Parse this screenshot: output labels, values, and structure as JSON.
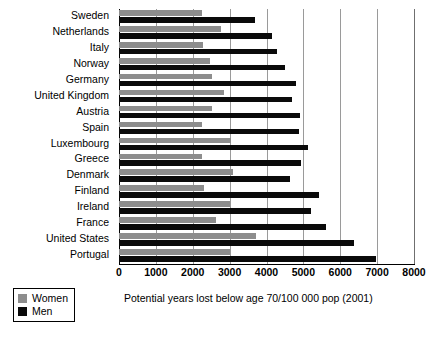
{
  "chart_data": {
    "type": "bar",
    "orientation": "horizontal",
    "title": "",
    "subtitle": "",
    "xlabel": "Potential years lost below age 70/100 000 pop (2001)",
    "ylabel": "",
    "xlim": [
      0,
      8000
    ],
    "xticks": [
      0,
      1000,
      2000,
      3000,
      4000,
      5000,
      6000,
      7000,
      8000
    ],
    "xticklabels": [
      "0",
      "1000",
      "2000",
      "3000",
      "4000",
      "5000",
      "6000",
      "7000",
      "8000"
    ],
    "grid": "vertical",
    "legend_position": "bottom-left",
    "categories": [
      "Sweden",
      "Netherlands",
      "Italy",
      "Norway",
      "Germany",
      "United Kingdom",
      "Austria",
      "Spain",
      "Luxembourg",
      "Greece",
      "Denmark",
      "Finland",
      "Ireland",
      "France",
      "United States",
      "Portugal"
    ],
    "series": [
      {
        "name": "Women",
        "color": "#8d8d8d",
        "values": [
          2250,
          2760,
          2280,
          2480,
          2510,
          2850,
          2520,
          2250,
          3030,
          2240,
          3090,
          2310,
          3020,
          2640,
          3720,
          3020
        ]
      },
      {
        "name": "Men",
        "color": "#0a0a0a",
        "values": [
          3680,
          4150,
          4290,
          4500,
          4800,
          4680,
          4920,
          4870,
          5120,
          4940,
          4650,
          5430,
          5210,
          5600,
          6380,
          6960
        ]
      }
    ]
  },
  "legend": {
    "items": [
      {
        "label": "Women",
        "color": "#8d8d8d"
      },
      {
        "label": "Men",
        "color": "#0a0a0a"
      }
    ]
  }
}
